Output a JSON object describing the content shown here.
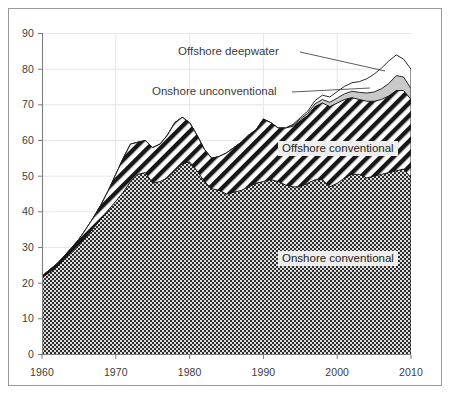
{
  "chart_data": {
    "type": "area",
    "stacked": true,
    "title": "",
    "xlabel": "",
    "ylabel": "",
    "xlim": [
      1960,
      2010
    ],
    "ylim": [
      0,
      90
    ],
    "grid": true,
    "legend_position": "inline-annotations",
    "xticks": [
      "1960",
      "1970",
      "1980",
      "1990",
      "2000",
      "2010"
    ],
    "yticks": [
      "0",
      "10",
      "20",
      "30",
      "40",
      "50",
      "60",
      "70",
      "80",
      "90"
    ],
    "x": [
      1960,
      1961,
      1962,
      1963,
      1964,
      1965,
      1966,
      1967,
      1968,
      1969,
      1970,
      1971,
      1972,
      1973,
      1974,
      1975,
      1976,
      1977,
      1978,
      1979,
      1980,
      1981,
      1982,
      1983,
      1984,
      1985,
      1986,
      1987,
      1988,
      1989,
      1990,
      1991,
      1992,
      1993,
      1994,
      1995,
      1996,
      1997,
      1998,
      1999,
      2000,
      2001,
      2002,
      2003,
      2004,
      2005,
      2006,
      2007,
      2008,
      2009,
      2010
    ],
    "series": [
      {
        "name": "Onshore conventional",
        "pattern": "checkerboard-dark",
        "values": [
          21.5,
          23.0,
          24.5,
          26.5,
          28.5,
          30.5,
          33.0,
          35.5,
          38.0,
          40.5,
          43.0,
          45.5,
          48.5,
          50.5,
          51.0,
          48.0,
          48.5,
          49.5,
          51.5,
          53.5,
          54.0,
          51.5,
          48.5,
          46.5,
          46.0,
          45.0,
          45.5,
          46.0,
          47.0,
          48.0,
          48.5,
          49.0,
          48.5,
          47.5,
          47.0,
          47.0,
          48.0,
          49.0,
          49.0,
          47.0,
          48.0,
          49.5,
          50.5,
          50.5,
          49.5,
          50.0,
          50.5,
          51.0,
          51.5,
          52.0,
          49.5
        ]
      },
      {
        "name": "Offshore conventional",
        "pattern": "diagonal-hatch",
        "values": [
          0.5,
          0.7,
          0.9,
          1.1,
          1.4,
          1.8,
          2.3,
          3.0,
          4.0,
          5.5,
          7.5,
          9.5,
          10.5,
          9.0,
          9.0,
          10.0,
          10.5,
          12.0,
          13.5,
          13.0,
          11.0,
          10.0,
          9.0,
          8.5,
          9.5,
          11.5,
          12.5,
          13.5,
          14.5,
          15.0,
          17.5,
          16.0,
          15.0,
          16.0,
          17.0,
          18.5,
          19.0,
          20.5,
          21.5,
          22.5,
          22.5,
          22.0,
          21.5,
          21.0,
          21.5,
          21.0,
          21.0,
          21.5,
          22.5,
          22.0,
          22.0
        ]
      },
      {
        "name": "Onshore unconventional",
        "pattern": "light-gray",
        "values": [
          0,
          0,
          0,
          0,
          0,
          0,
          0,
          0,
          0,
          0,
          0,
          0,
          0,
          0,
          0,
          0,
          0,
          0,
          0,
          0,
          0,
          0,
          0,
          0,
          0,
          0,
          0,
          0,
          0,
          0,
          0,
          0,
          0,
          0,
          0.3,
          0.5,
          0.6,
          0.8,
          1.0,
          1.2,
          1.4,
          1.6,
          1.8,
          2.0,
          2.3,
          2.6,
          3.0,
          3.5,
          4.2,
          3.8,
          3.0
        ]
      },
      {
        "name": "Offshore deepwater",
        "pattern": "white",
        "values": [
          0,
          0,
          0,
          0,
          0,
          0,
          0,
          0,
          0,
          0,
          0,
          0,
          0,
          0,
          0,
          0,
          0,
          0,
          0,
          0,
          0,
          0,
          0,
          0,
          0,
          0,
          0,
          0,
          0,
          0,
          0,
          0,
          0,
          0,
          0.2,
          0.4,
          0.6,
          0.9,
          1.2,
          1.5,
          1.8,
          2.1,
          2.4,
          3.0,
          4.0,
          5.0,
          5.8,
          6.3,
          5.8,
          5.0,
          5.5
        ]
      }
    ],
    "annotations": [
      {
        "id": "offshore-deepwater",
        "text": "Offshore deepwater"
      },
      {
        "id": "onshore-unconventional",
        "text": "Onshore unconventional"
      },
      {
        "id": "offshore-conventional",
        "text": "Offshore conventional"
      },
      {
        "id": "onshore-conventional",
        "text": "Onshore conventional"
      }
    ],
    "colors": {
      "frame": "#9a9a9a",
      "axis": "#808080",
      "grid": "#e4e4e4",
      "tick_text": "#3c3c3c",
      "onshore_conventional": "#3a3a3a",
      "offshore_conventional": "#1a1a1a",
      "onshore_unconventional": "#c8c8c8",
      "offshore_deepwater": "#ffffff",
      "label_box": "#eeeeee"
    }
  }
}
